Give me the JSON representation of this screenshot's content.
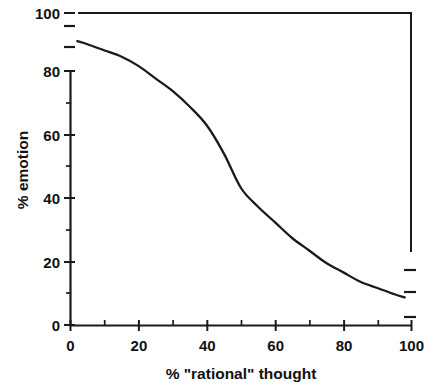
{
  "chart_data": {
    "type": "line",
    "title": "",
    "xlabel": "% \"rational\" thought",
    "ylabel": "% emotion",
    "xlim": [
      0,
      100
    ],
    "ylim": [
      0,
      100
    ],
    "grid": false,
    "legend": null,
    "x_ticks_major": [
      0,
      20,
      40,
      60,
      80,
      100
    ],
    "x_tick_labels": [
      "0",
      "20",
      "40",
      "60",
      "80",
      "100"
    ],
    "x_ticks_minor": [
      10,
      30,
      50,
      70,
      90
    ],
    "y_ticks_major": [
      0,
      20,
      40,
      60,
      80,
      100
    ],
    "y_tick_labels": [
      "0",
      "20",
      "40",
      "60",
      "80",
      "100"
    ],
    "y_ticks_minor": [
      10,
      30,
      50,
      70,
      90
    ],
    "series": [
      {
        "name": "% emotion vs % rational thought",
        "x": [
          2,
          5,
          10,
          15,
          20,
          25,
          30,
          35,
          40,
          45,
          50,
          55,
          60,
          65,
          70,
          75,
          80,
          85,
          90,
          95,
          98
        ],
        "y": [
          91,
          90,
          88,
          86,
          83,
          79,
          75,
          70,
          64,
          55,
          44,
          38,
          33,
          28,
          24,
          20,
          17,
          14,
          12,
          10,
          9
        ]
      }
    ],
    "annotations": [
      {
        "name": "top-frame-line",
        "type": "horizontal-rule",
        "y": 100,
        "x_from": 2,
        "x_to": 100
      },
      {
        "name": "right-frame-line",
        "type": "vertical-rule",
        "x": 100,
        "y_from": 23,
        "y_to": 100
      },
      {
        "name": "right-dash-upper",
        "type": "dash",
        "x": 100,
        "y": 18
      },
      {
        "name": "right-dash-lower",
        "type": "dash",
        "x": 100,
        "y": 11
      },
      {
        "name": "right-dash-baseline",
        "type": "dash",
        "x": 100,
        "y": 3
      },
      {
        "name": "left-dash-upper",
        "type": "dash",
        "x": 0,
        "y": 96
      },
      {
        "name": "left-dash-lower",
        "type": "dash",
        "x": 0,
        "y": 89
      }
    ]
  }
}
